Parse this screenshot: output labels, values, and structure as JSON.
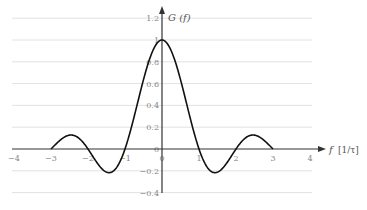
{
  "chart_data": {
    "type": "line",
    "title": "",
    "xlabel": "f [1/τ]",
    "ylabel": "G (f)",
    "xlim": [
      -4,
      4
    ],
    "ylim": [
      -0.4,
      1.2
    ],
    "grid": true,
    "grid_axis": "y",
    "x_ticks": [
      -4,
      -3,
      -2,
      -1,
      0,
      1,
      2,
      3,
      4
    ],
    "x_tick_labels": [
      "−4",
      "−3",
      "−2",
      "−1",
      "0",
      "1",
      "2",
      "3",
      "4"
    ],
    "y_ticks": [
      1.2,
      1,
      0.8,
      0.6,
      0.4,
      0.2,
      0,
      -0.2,
      -0.4
    ],
    "y_tick_labels": [
      "1.2",
      "1",
      "0.8",
      "0.6",
      "0.4",
      "0.2",
      "0",
      "−0.2",
      "−0.4"
    ],
    "series": [
      {
        "name": "G(f) = sinc(f), |f| ≤ 3",
        "function": "sin(pi f)/(pi f)",
        "x_range": [
          -3,
          3
        ],
        "x": [
          -3,
          -2.5,
          -2,
          -1.5,
          -1,
          -0.5,
          0,
          0.5,
          1,
          1.5,
          2,
          2.5,
          3
        ],
        "values": [
          0,
          0.127,
          0,
          -0.212,
          0,
          0.637,
          1,
          0.637,
          0,
          -0.212,
          0,
          0.127,
          0
        ],
        "color": "#111111"
      }
    ],
    "legend": "none"
  },
  "labels": {
    "y_axis": "G (f)",
    "x_axis_var": "f",
    "x_axis_unit": "[1/τ]"
  }
}
